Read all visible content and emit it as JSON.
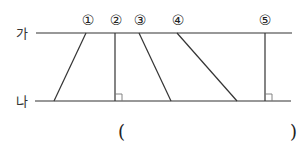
{
  "diagram": {
    "lines": [
      {
        "id": "ga",
        "label": "가",
        "y": 33,
        "x1": 36,
        "x2": 292
      },
      {
        "id": "na",
        "label": "나",
        "y": 101,
        "x1": 35,
        "x2": 291
      }
    ],
    "segments": [
      {
        "label": "①",
        "top_x": 86,
        "bottom_x": 54,
        "perpendicular": false
      },
      {
        "label": "②",
        "top_x": 115,
        "bottom_x": 115,
        "perpendicular": true
      },
      {
        "label": "③",
        "top_x": 139,
        "bottom_x": 171,
        "perpendicular": false
      },
      {
        "label": "④",
        "top_x": 177,
        "bottom_x": 237,
        "perpendicular": false
      },
      {
        "label": "⑤",
        "top_x": 265,
        "bottom_x": 265,
        "perpendicular": true
      }
    ],
    "answer_blank": {
      "open": "(",
      "close": ")"
    }
  }
}
